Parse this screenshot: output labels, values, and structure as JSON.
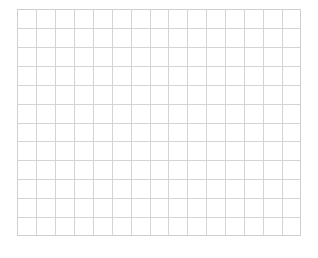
{
  "canvas": {
    "width": 318,
    "height": 258,
    "background_color": "#ffffff"
  },
  "grid": {
    "label": "blank-grid",
    "x": 17,
    "y": 9,
    "width": 284,
    "height": 227,
    "columns": 15,
    "rows": 12,
    "cell_width": 18.93,
    "cell_height": 18.92,
    "line_color": "#d4d4d4",
    "line_width": 1,
    "border_color": "#cfcfcf",
    "border_width": 1,
    "fill_color": "#ffffff"
  },
  "content": {
    "title": "",
    "has_text": false,
    "has_data": false,
    "note": ""
  },
  "chart_data": {
    "type": "table",
    "title": "",
    "xlabel": "",
    "ylabel": "",
    "categories": [],
    "values": [],
    "series": [],
    "grid": true,
    "legend_position": "none",
    "columns": 15,
    "rows": 12,
    "annotations": []
  }
}
